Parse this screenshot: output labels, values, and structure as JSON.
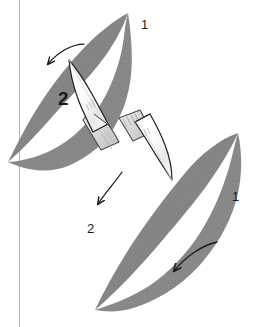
{
  "figure": {
    "background_color": "#ffffff",
    "width": 258,
    "height": 327
  },
  "colors": {
    "leaf_fill": "#8a8a8a",
    "leaf_fill_dark": "#7b7b7b",
    "leaf_fill_light": "#9a9a9a",
    "leaf_outline": "#6e6e6e",
    "blade_fill": "#fbfbfb",
    "blade_outline": "#1e1e1e",
    "handle_fill": "#d8d8d8",
    "handle_outline": "#3a3a3a",
    "arrow_stroke": "#1a1a1a",
    "guide_line": "#b5b5b5",
    "label_color": "#1a1a1a"
  },
  "guide_line": {
    "name": "vertical-guide-line",
    "x": 19,
    "y_top": 0,
    "y_bottom": 327,
    "color": "#b5b5b5",
    "width": 1
  },
  "labels": [
    {
      "id": "label-1-top",
      "text": "1",
      "x": 141,
      "y": 18,
      "weight": "thin",
      "refers_to": "upper-leaf"
    },
    {
      "id": "label-2-upper",
      "text": "2",
      "x": 58,
      "y": 89,
      "weight": "bold",
      "refers_to": "upper-scalpel-cut"
    },
    {
      "id": "label-2-lower",
      "text": "2",
      "x": 87,
      "y": 222,
      "weight": "thin",
      "refers_to": "lower-scalpel-cut"
    },
    {
      "id": "label-1-bottom",
      "text": "1",
      "x": 232,
      "y": 190,
      "weight": "thin",
      "refers_to": "lower-leaf"
    }
  ],
  "leaves": [
    {
      "id": "upper-leaf",
      "name": "upper-leaf-shape",
      "orientation": "tilted up-right to down-left",
      "tip_top": [
        128,
        13
      ],
      "tip_bottom": [
        8,
        162
      ],
      "fill": "#8a8a8a"
    },
    {
      "id": "lower-leaf",
      "name": "lower-leaf-shape",
      "orientation": "tilted up-right to down-left",
      "tip_top": [
        238,
        133
      ],
      "tip_bottom": [
        95,
        310
      ],
      "fill": "#8a8a8a"
    }
  ],
  "scalpels": [
    {
      "id": "upper-scalpel",
      "name": "upper-scalpel",
      "blade_tip": [
        69,
        60
      ],
      "handle_end": [
        119,
        142
      ],
      "direction": "points up-left",
      "has_blade_marking": true
    },
    {
      "id": "lower-scalpel",
      "name": "lower-scalpel",
      "blade_tip": [
        172,
        180
      ],
      "handle_end": [
        119,
        118
      ],
      "direction": "points down-right",
      "has_blade_marking": true
    }
  ],
  "arrows": [
    {
      "id": "arrow-upper",
      "name": "arrow-upper-left",
      "from": [
        81,
        45
      ],
      "to": [
        47,
        66
      ],
      "direction": "down-left",
      "curved": true
    },
    {
      "id": "arrow-middle",
      "name": "arrow-middle-left",
      "from": [
        120,
        173
      ],
      "to": [
        96,
        206
      ],
      "direction": "down-left",
      "curved": true
    },
    {
      "id": "arrow-lower",
      "name": "arrow-lower-left",
      "from": [
        216,
        243
      ],
      "to": [
        172,
        273
      ],
      "direction": "down-left",
      "curved": true
    }
  ]
}
